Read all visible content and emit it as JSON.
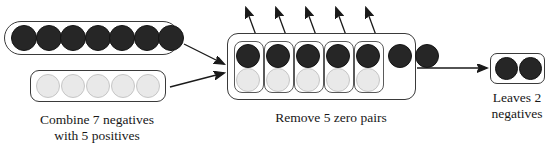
{
  "diagram": {
    "type": "process-flow",
    "colors": {
      "negative_chip": "#262626",
      "positive_chip": "#e9e9e9",
      "outline": "#3a3a3a",
      "background": "#ffffff"
    },
    "steps": [
      {
        "id": "step-combine",
        "caption": "Combine 7 negatives\nwith 5 positives",
        "groups": [
          {
            "id": "negatives-group",
            "sign": "negative",
            "count": 7
          },
          {
            "id": "positives-group",
            "sign": "positive",
            "count": 5
          }
        ]
      },
      {
        "id": "step-remove",
        "caption": "Remove 5 zero pairs",
        "zero_pairs": 5,
        "leftover_negatives": 2,
        "total_negatives": 7,
        "total_positives": 5
      },
      {
        "id": "step-result",
        "caption": "Leaves 2\nnegatives",
        "result_count": 2,
        "result_sign": "negative"
      }
    ],
    "arrows": [
      {
        "id": "arrow-negatives-to-combined",
        "from": "negatives-group",
        "to": "combined-box"
      },
      {
        "id": "arrow-positives-to-combined",
        "from": "positives-group",
        "to": "combined-box"
      },
      {
        "id": "arrow-zero-pair-1",
        "from": "zero-pair-1",
        "to": "removed"
      },
      {
        "id": "arrow-zero-pair-2",
        "from": "zero-pair-2",
        "to": "removed"
      },
      {
        "id": "arrow-zero-pair-3",
        "from": "zero-pair-3",
        "to": "removed"
      },
      {
        "id": "arrow-zero-pair-4",
        "from": "zero-pair-4",
        "to": "removed"
      },
      {
        "id": "arrow-zero-pair-5",
        "from": "zero-pair-5",
        "to": "removed"
      },
      {
        "id": "arrow-combined-to-result",
        "from": "combined-box",
        "to": "result-box"
      }
    ]
  }
}
